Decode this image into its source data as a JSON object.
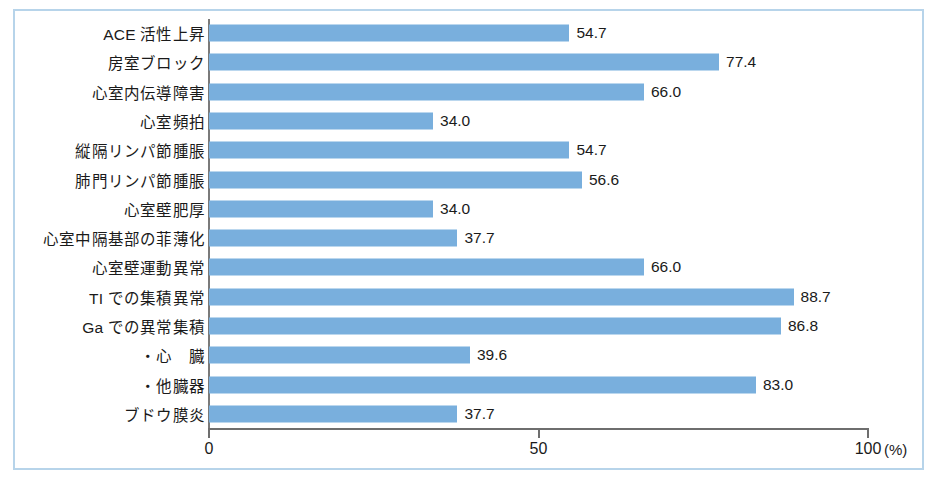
{
  "chart_data": {
    "type": "bar",
    "orientation": "horizontal",
    "title": "",
    "xlabel": "(%)",
    "ylabel": "",
    "xlim": [
      0,
      100
    ],
    "xticks": [
      0,
      50,
      100
    ],
    "xtick_labels": [
      "0",
      "50",
      "100"
    ],
    "grid": false,
    "legend": null,
    "bar_color": "#79afdd",
    "frame_color": "#b7d4ea",
    "axis_color": "#6e6e6e",
    "value_label_format": "one-decimal",
    "categories": [
      "ACE 活性上昇",
      "房室ブロック",
      "心室内伝導障害",
      "心室頻拍",
      "縦隔リンパ節腫脹",
      "肺門リンパ節腫脹",
      "心室壁肥厚",
      "心室中隔基部の菲薄化",
      "心室壁運動異常",
      "TI での集積異常",
      "Ga での異常集積",
      "・心　臓",
      "・他臓器",
      "ブドウ膜炎"
    ],
    "values": [
      54.7,
      77.4,
      66.0,
      34.0,
      54.7,
      56.6,
      34.0,
      37.7,
      66.0,
      88.7,
      86.8,
      39.6,
      83.0,
      37.7
    ],
    "value_labels": [
      "54.7",
      "77.4",
      "66.0",
      "34.0",
      "54.7",
      "56.6",
      "34.0",
      "37.7",
      "66.0",
      "88.7",
      "86.8",
      "39.6",
      "83.0",
      "37.7"
    ]
  },
  "axis": {
    "unit_label": "(%)",
    "ticks": [
      {
        "label": "0",
        "value": 0
      },
      {
        "label": "50",
        "value": 50
      },
      {
        "label": "100",
        "value": 100
      }
    ]
  }
}
